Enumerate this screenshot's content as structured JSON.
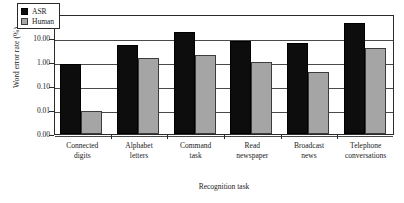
{
  "chart_data": {
    "type": "bar",
    "title": "",
    "xlabel": "Recognition task",
    "ylabel": "Word error rate (%)",
    "yscale": "log",
    "ylim": [
      0.001,
      100
    ],
    "ytick_labels": [
      "100.00",
      "10.00",
      "1.00",
      "0.10",
      "0.01",
      "0.00"
    ],
    "ytick_values": [
      100,
      10,
      1,
      0.1,
      0.01,
      0.001
    ],
    "grid": true,
    "legend_position": "top-left",
    "categories": [
      "Connected digits",
      "Alphabet letters",
      "Command task",
      "Read newspaper",
      "Broadcast news",
      "Telephone conversations"
    ],
    "category_lines": [
      [
        "Connected",
        "digits"
      ],
      [
        "Alphabet",
        "letters"
      ],
      [
        "Command",
        "task"
      ],
      [
        "Read",
        "newspaper"
      ],
      [
        "Broadcast",
        "news"
      ],
      [
        "Telephone",
        "conversations"
      ]
    ],
    "series": [
      {
        "name": "ASR",
        "color": "#0d0d0d",
        "values": [
          0.8,
          5.0,
          17.0,
          7.5,
          6.5,
          43.0
        ]
      },
      {
        "name": "Human",
        "color": "#a5a5a5",
        "values": [
          0.009,
          1.5,
          2.0,
          1.0,
          0.4,
          3.8
        ]
      }
    ]
  },
  "legend": {
    "items": [
      {
        "label": "ASR",
        "swatch": "asr"
      },
      {
        "label": "Human",
        "swatch": "human"
      }
    ]
  },
  "axes": {
    "y_title": "Word error rate (%)",
    "x_title": "Recognition task"
  }
}
